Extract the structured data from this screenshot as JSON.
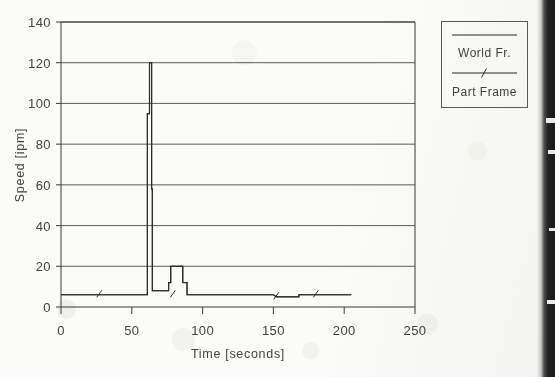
{
  "chart_data": {
    "type": "line",
    "title": "",
    "xlabel": "Time [seconds]",
    "ylabel": "Speed [ipm]",
    "xlim": [
      0,
      250
    ],
    "ylim": [
      0,
      140
    ],
    "xticks": [
      0,
      50,
      100,
      150,
      200,
      250
    ],
    "yticks": [
      0,
      20,
      40,
      60,
      80,
      100,
      120,
      140
    ],
    "grid": "horizontal",
    "legend_position": "outside-top-right",
    "series": [
      {
        "name": "World Fr.",
        "marker": "none",
        "points": [
          [
            0,
            6
          ],
          [
            27,
            6
          ],
          [
            61,
            6
          ],
          [
            61,
            95
          ],
          [
            62.5,
            95
          ],
          [
            62.5,
            120
          ],
          [
            64,
            120
          ],
          [
            64,
            58
          ],
          [
            64.5,
            58
          ],
          [
            64.5,
            8
          ],
          [
            66,
            8
          ],
          [
            76,
            8
          ],
          [
            76,
            12
          ],
          [
            77.5,
            12
          ],
          [
            77.5,
            20
          ],
          [
            85,
            20
          ],
          [
            86,
            20
          ],
          [
            86,
            12
          ],
          [
            89,
            12
          ],
          [
            89,
            6
          ],
          [
            120,
            6
          ],
          [
            150,
            6
          ],
          [
            152,
            5
          ],
          [
            168,
            5
          ],
          [
            168,
            6
          ],
          [
            205,
            6
          ]
        ]
      },
      {
        "name": "Part Frame",
        "marker": "tick",
        "marker_positions": [
          [
            27,
            6
          ],
          [
            79,
            6
          ],
          [
            152,
            5
          ],
          [
            180,
            6
          ]
        ],
        "points": [
          [
            0,
            6
          ],
          [
            27,
            6
          ],
          [
            61,
            6
          ],
          [
            61,
            95
          ],
          [
            62.5,
            95
          ],
          [
            62.5,
            120
          ],
          [
            64,
            120
          ],
          [
            64,
            58
          ],
          [
            64.5,
            58
          ],
          [
            64.5,
            8
          ],
          [
            66,
            8
          ],
          [
            76,
            8
          ],
          [
            76,
            12
          ],
          [
            77.5,
            12
          ],
          [
            77.5,
            20
          ],
          [
            85,
            20
          ],
          [
            86,
            20
          ],
          [
            86,
            12
          ],
          [
            89,
            12
          ],
          [
            89,
            6
          ],
          [
            120,
            6
          ],
          [
            150,
            6
          ],
          [
            152,
            5
          ],
          [
            168,
            5
          ],
          [
            168,
            6
          ],
          [
            205,
            6
          ]
        ]
      }
    ]
  },
  "legend": {
    "entries": [
      {
        "label": "World Fr.",
        "style": "solid-line"
      },
      {
        "label": "Part Frame",
        "style": "solid-line-with-tick-marker"
      }
    ]
  },
  "axes": {
    "x_title": "Time [seconds]",
    "y_title": "Speed [ipm]",
    "x_tick_labels": [
      "0",
      "50",
      "100",
      "150",
      "200",
      "250"
    ],
    "y_tick_labels": [
      "0",
      "20",
      "40",
      "60",
      "80",
      "100",
      "120",
      "140"
    ]
  },
  "colors": {
    "background": "#fbfbf8",
    "ink": "#2b2b29",
    "grid": "#4a4a46",
    "edge_shadow": "#1a1a18"
  }
}
